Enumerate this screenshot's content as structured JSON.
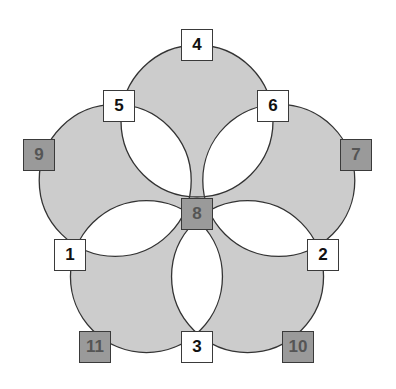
{
  "diagram": {
    "type": "five-circle-rosette",
    "colors": {
      "circle_fill": "#cccccc",
      "overlap_fill": "#ffffff",
      "stroke": "#333333",
      "white_node_fill": "#ffffff",
      "dark_node_fill": "#9a9a9a",
      "dark_node_text": "#555555"
    },
    "center": {
      "x": 197,
      "y": 207
    },
    "circle_offset": 86,
    "circle_radius": 76,
    "nodes": [
      {
        "label": "1",
        "style": "white",
        "x": 54,
        "y": 239
      },
      {
        "label": "2",
        "style": "white",
        "x": 307,
        "y": 239
      },
      {
        "label": "3",
        "style": "white",
        "x": 181,
        "y": 331
      },
      {
        "label": "4",
        "style": "white",
        "x": 181,
        "y": 29
      },
      {
        "label": "5",
        "style": "white",
        "x": 103,
        "y": 90
      },
      {
        "label": "6",
        "style": "white",
        "x": 257,
        "y": 90
      },
      {
        "label": "7",
        "style": "dark",
        "x": 340,
        "y": 139
      },
      {
        "label": "8",
        "style": "dark",
        "x": 181,
        "y": 198
      },
      {
        "label": "9",
        "style": "dark",
        "x": 23,
        "y": 139
      },
      {
        "label": "10",
        "style": "dark",
        "x": 282,
        "y": 331
      },
      {
        "label": "11",
        "style": "dark",
        "x": 79,
        "y": 331
      }
    ]
  }
}
